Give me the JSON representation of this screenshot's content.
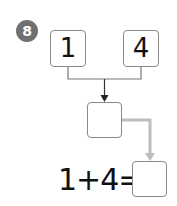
{
  "problem": {
    "number": "8",
    "left_value": "1",
    "right_value": "4",
    "middle_box_value": "",
    "equation": "1+4=",
    "answer_box_value": ""
  },
  "colors": {
    "badge": "#707070",
    "box_border": "#8a8a8a",
    "connector": "#555555",
    "arrow_gray": "#bbbbbb"
  }
}
